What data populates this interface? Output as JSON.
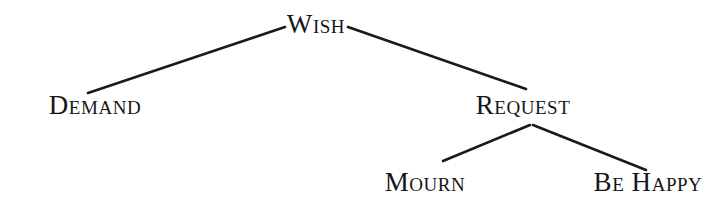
{
  "diagram": {
    "type": "tree",
    "title": "",
    "background_color": "#ffffff",
    "line_color": "#1a1a1a",
    "text_color": "#16161a",
    "nodes": [
      {
        "id": "wish",
        "label": "Wish",
        "x": 316,
        "y": 24,
        "level": 0
      },
      {
        "id": "demand",
        "label": "Demand",
        "x": 95,
        "y": 105,
        "level": 1
      },
      {
        "id": "request",
        "label": "Request",
        "x": 523,
        "y": 105,
        "level": 1
      },
      {
        "id": "mourn",
        "label": "Mourn",
        "x": 425,
        "y": 182,
        "level": 2
      },
      {
        "id": "behappy",
        "label": "Be Happy",
        "x": 648,
        "y": 182,
        "level": 2
      }
    ],
    "edges": [
      {
        "id": "wish-demand",
        "from": "wish",
        "to": "demand",
        "x1": 285,
        "y1": 27,
        "x2": 88,
        "y2": 93
      },
      {
        "id": "wish-request",
        "from": "wish",
        "to": "request",
        "x1": 348,
        "y1": 27,
        "x2": 526,
        "y2": 89
      },
      {
        "id": "request-mourn",
        "from": "request",
        "to": "mourn",
        "x1": 530,
        "y1": 125,
        "x2": 443,
        "y2": 161
      },
      {
        "id": "request-behappy",
        "from": "request",
        "to": "behappy",
        "x1": 533,
        "y1": 125,
        "x2": 646,
        "y2": 170
      }
    ]
  }
}
